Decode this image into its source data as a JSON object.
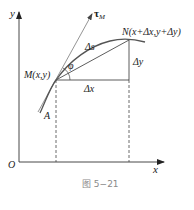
{
  "figure": {
    "caption": "图 5−21",
    "axes": {
      "x_label": "x",
      "y_label": "y",
      "origin_label": "O"
    },
    "points": {
      "M": "M(x,y)",
      "N": "N(x+Δx,y+Δy)",
      "A": "A"
    },
    "labels": {
      "tangent_symbol": "τ",
      "tangent_subscript": "M",
      "arc": "Δs",
      "delta_x": "Δx",
      "delta_y": "Δy",
      "angle": "φ"
    },
    "colors": {
      "line": "#333333",
      "curve": "#555555",
      "caption": "#8a8a8a"
    }
  }
}
